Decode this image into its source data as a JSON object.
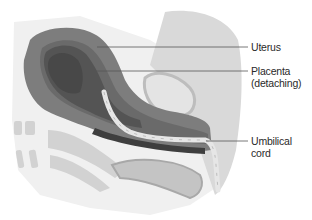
{
  "diagram": {
    "labels": [
      {
        "id": "uterus",
        "lines": [
          "Uterus"
        ],
        "x": 251,
        "y": 41,
        "leader": {
          "x1": 97,
          "y1": 47,
          "x2": 248,
          "y2": 47
        }
      },
      {
        "id": "placenta",
        "lines": [
          "Placenta",
          "(detaching)"
        ],
        "x": 251,
        "y": 65,
        "leader": {
          "x1": 92,
          "y1": 71,
          "x2": 248,
          "y2": 71
        }
      },
      {
        "id": "umbilical-cord",
        "lines": [
          "Umbilical",
          "cord"
        ],
        "x": 251,
        "y": 135,
        "leader": {
          "x1": 206,
          "y1": 141,
          "x2": 248,
          "y2": 141
        }
      }
    ],
    "colors": {
      "background": "#ffffff",
      "uterus_wall": "#7d7d7d",
      "uterus_wall_inner": "#6a6a6a",
      "placenta": "#5a5a5a",
      "cavity": "#4a4a4a",
      "cord": "#e2e2e2",
      "body_tissue": "#d6d6d6",
      "light_tissue": "#ececec",
      "leader": "#555555",
      "text": "#2a2a2a"
    }
  }
}
